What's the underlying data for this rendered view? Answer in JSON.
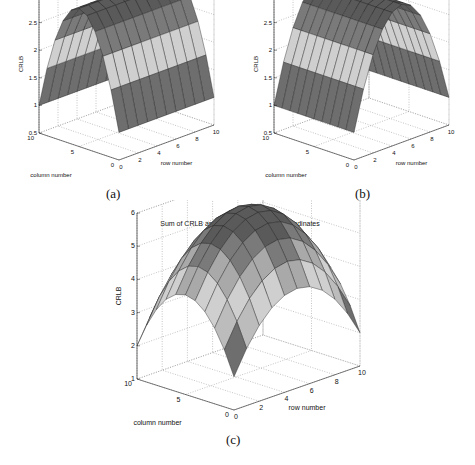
{
  "chart_data": [
    {
      "id": "a",
      "type": "surface",
      "title": "CRLB associated with X-coordinates",
      "xlabel": "row number",
      "ylabel": "column number",
      "zlabel": "CRLB",
      "caption": "(a)",
      "x_ticks": [
        "0",
        "2",
        "4",
        "6",
        "8",
        "10"
      ],
      "y_ticks": [
        "0",
        "5",
        "10"
      ],
      "z_ticks": [
        "0.5",
        "1",
        "1.5",
        "2",
        "2.5",
        "3"
      ],
      "xlim": [
        0,
        10
      ],
      "ylim": [
        0,
        10
      ],
      "zlim": [
        0.5,
        3
      ],
      "grid": true,
      "surface": "z = 1 + 2*(1 - ((column-5)/5)^2), constant along row; min ≈ 1 at column 0/10, max ≈ 3 at column 5",
      "z_min": 1.0,
      "z_max": 3.0,
      "depends_on": "column"
    },
    {
      "id": "b",
      "type": "surface",
      "title": "CRLB associated with Y-coordinates",
      "xlabel": "row number",
      "ylabel": "column number",
      "zlabel": "CRLB",
      "caption": "(b)",
      "x_ticks": [
        "0",
        "2",
        "4",
        "6",
        "8",
        "10"
      ],
      "y_ticks": [
        "0",
        "5",
        "10"
      ],
      "z_ticks": [
        "0.5",
        "1",
        "1.5",
        "2",
        "2.5",
        "3"
      ],
      "xlim": [
        0,
        10
      ],
      "ylim": [
        0,
        10
      ],
      "zlim": [
        0.5,
        3
      ],
      "grid": true,
      "surface": "z = 1 + 2*(1 - ((row-5)/5)^2), constant along column; min ≈ 1 at row 0/10, max ≈ 3 at row 5",
      "z_min": 1.0,
      "z_max": 3.0,
      "depends_on": "row"
    },
    {
      "id": "c",
      "type": "surface",
      "title": "Sum of CRLB associated with X- and Y-coordinates",
      "xlabel": "row number",
      "ylabel": "column number",
      "zlabel": "CRLB",
      "caption": "(c)",
      "x_ticks": [
        "0",
        "2",
        "4",
        "6",
        "8",
        "10"
      ],
      "y_ticks": [
        "0",
        "5",
        "10"
      ],
      "z_ticks": [
        "1",
        "2",
        "3",
        "4",
        "5",
        "6"
      ],
      "xlim": [
        0,
        10
      ],
      "ylim": [
        0,
        10
      ],
      "zlim": [
        1,
        6
      ],
      "grid": true,
      "surface": "sum of (a) and (b); min ≈ 2 at corners, max ≈ 6 at center (5,5)",
      "z_min": 2.0,
      "z_max": 6.0,
      "depends_on": "both"
    }
  ]
}
